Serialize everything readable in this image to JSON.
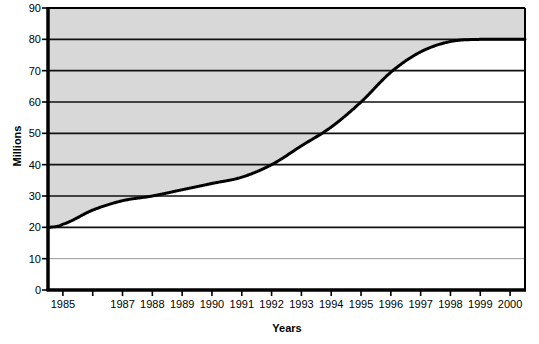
{
  "chart_data": {
    "type": "area",
    "title": "",
    "xlabel": "Years",
    "ylabel": "Millions",
    "grid": true,
    "legend": false,
    "shading": "above-curve",
    "shading_color": "#d8d8d8",
    "line_color": "#000000",
    "plot_bg": "#ffffff",
    "xlim": [
      1984.5,
      2000.5
    ],
    "ylim": [
      0,
      90
    ],
    "yticks": [
      0,
      10,
      20,
      30,
      40,
      50,
      60,
      70,
      80,
      90
    ],
    "ytick_labels": [
      "0",
      "10",
      "20",
      "30",
      "40",
      "50",
      "60",
      "70",
      "80",
      "90"
    ],
    "xtick_labels": [
      "1985",
      "1987",
      "1988",
      "1989",
      "1990",
      "1991",
      "1992",
      "1993",
      "1994",
      "1995",
      "1996",
      "1997",
      "1998",
      "1999",
      "2000"
    ],
    "xtick_count": 16,
    "x": [
      1984.5,
      1985,
      1986,
      1987,
      1988,
      1989,
      1990,
      1991,
      1992,
      1993,
      1994,
      1995,
      1996,
      1997,
      1998,
      1999,
      2000,
      2000.5
    ],
    "values": [
      20,
      21,
      25.5,
      28.5,
      30,
      32,
      34,
      36,
      40,
      46,
      52,
      60,
      69.5,
      76,
      79.3,
      80,
      80,
      80
    ],
    "series": [
      {
        "name": "Millions",
        "values": [
          20,
          21,
          25.5,
          28.5,
          30,
          32,
          34,
          36,
          40,
          46,
          52,
          60,
          69.5,
          76,
          79.3,
          80,
          80,
          80
        ]
      }
    ]
  },
  "axes": {
    "ylabel": "Millions",
    "xlabel": "Years"
  }
}
